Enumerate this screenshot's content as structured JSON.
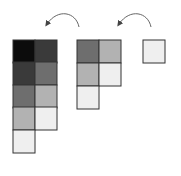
{
  "diagram": {
    "stroke_color": "#333333",
    "arrow_color": "#666666",
    "groups": [
      {
        "name": "left-staircase",
        "cells": [
          {
            "x": 13,
            "y": 40,
            "fill": "#0c0c0c"
          },
          {
            "x": 35,
            "y": 40,
            "fill": "#3a3a3a"
          },
          {
            "x": 13,
            "y": 62,
            "fill": "#3a3a3a"
          },
          {
            "x": 35,
            "y": 62,
            "fill": "#6e6e6e"
          },
          {
            "x": 13,
            "y": 85,
            "fill": "#6e6e6e"
          },
          {
            "x": 35,
            "y": 85,
            "fill": "#b2b2b2"
          },
          {
            "x": 13,
            "y": 107,
            "fill": "#b2b2b2"
          },
          {
            "x": 35,
            "y": 107,
            "fill": "#efefef"
          },
          {
            "x": 13,
            "y": 130,
            "fill": "#efefef"
          }
        ]
      },
      {
        "name": "middle-staircase",
        "cells": [
          {
            "x": 77,
            "y": 40,
            "fill": "#6e6e6e"
          },
          {
            "x": 99,
            "y": 40,
            "fill": "#b2b2b2"
          },
          {
            "x": 77,
            "y": 63,
            "fill": "#b2b2b2"
          },
          {
            "x": 99,
            "y": 63,
            "fill": "#efefef"
          },
          {
            "x": 77,
            "y": 86,
            "fill": "#efefef"
          }
        ]
      },
      {
        "name": "right-single",
        "cells": [
          {
            "x": 143,
            "y": 40,
            "fill": "#efefef"
          }
        ]
      }
    ],
    "arrows": [
      {
        "name": "arrow-middle-to-left",
        "path": "M79,27 C76,12 58,8 47,24"
      },
      {
        "name": "arrow-right-to-middle",
        "path": "M151,27 C148,12 130,8 119,24"
      }
    ]
  }
}
